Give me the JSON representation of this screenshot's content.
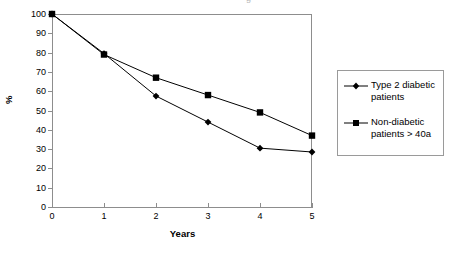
{
  "chart": {
    "title_remnant": "g",
    "xlabel": "Years",
    "ylabel": "%",
    "y_ticks": [
      "100",
      "90",
      "80",
      "70",
      "60",
      "50",
      "40",
      "30",
      "20",
      "10",
      "0"
    ],
    "x_ticks": [
      "0",
      "1",
      "2",
      "3",
      "4",
      "5"
    ],
    "legend": {
      "items": [
        {
          "label": "Type 2 diabetic patients",
          "marker": "diamond-marker-icon",
          "color": "#000000"
        },
        {
          "label": "Non-diabetic patients > 40a",
          "marker": "square-marker-icon",
          "color": "#000000"
        }
      ]
    }
  },
  "chart_data": {
    "type": "line",
    "title": "",
    "xlabel": "Years",
    "ylabel": "%",
    "x": [
      0,
      1,
      2,
      3,
      4,
      5
    ],
    "xlim": [
      0,
      5
    ],
    "ylim": [
      0,
      100
    ],
    "yticks": [
      0,
      10,
      20,
      30,
      40,
      50,
      60,
      70,
      80,
      90,
      100
    ],
    "xticks": [
      0,
      1,
      2,
      3,
      4,
      5
    ],
    "grid": false,
    "legend_position": "right",
    "series": [
      {
        "name": "Type 2 diabetic patients",
        "marker": "diamond",
        "color": "#000000",
        "values": [
          100,
          79.5,
          57.5,
          44,
          30.5,
          28.5
        ]
      },
      {
        "name": "Non-diabetic patients > 40a",
        "marker": "square",
        "color": "#000000",
        "values": [
          100,
          79,
          67,
          58,
          49,
          37
        ]
      }
    ]
  }
}
